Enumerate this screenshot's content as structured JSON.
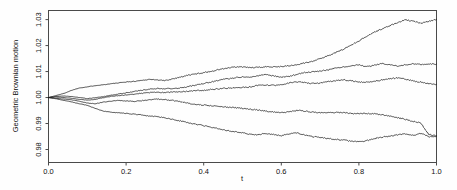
{
  "chart_data": {
    "type": "line",
    "title": "",
    "subtitle": "",
    "xlabel": "t",
    "ylabel": "Geometric Brownian motion",
    "xlim": [
      0.0,
      1.0
    ],
    "ylim": [
      0.975,
      1.0335
    ],
    "grid": false,
    "legend": null,
    "legend_position": "none",
    "x_ticks": [
      "0.0",
      "0.2",
      "0.4",
      "0.6",
      "0.8",
      "1.0"
    ],
    "x_tick_values": [
      0.0,
      0.2,
      0.4,
      0.6,
      0.8,
      1.0
    ],
    "y_ticks": [
      "0.98",
      "0.99",
      "1.00",
      "1.01",
      "1.02",
      "1.03"
    ],
    "y_tick_values": [
      0.98,
      0.99,
      1.0,
      1.01,
      1.02,
      1.03
    ],
    "x": [
      0.0,
      0.02,
      0.04,
      0.06,
      0.08,
      0.1,
      0.12,
      0.14,
      0.16,
      0.18,
      0.2,
      0.22,
      0.24,
      0.26,
      0.28,
      0.3,
      0.32,
      0.34,
      0.36,
      0.38,
      0.4,
      0.42,
      0.44,
      0.46,
      0.48,
      0.5,
      0.52,
      0.54,
      0.56,
      0.58,
      0.6,
      0.62,
      0.64,
      0.66,
      0.68,
      0.7,
      0.72,
      0.74,
      0.76,
      0.78,
      0.8,
      0.82,
      0.84,
      0.86,
      0.88,
      0.9,
      0.92,
      0.94,
      0.96,
      0.98,
      1.0
    ],
    "series": [
      {
        "name": "path-1",
        "values": [
          1.0,
          1.0008,
          1.0016,
          1.0028,
          1.0037,
          1.0041,
          1.0046,
          1.0049,
          1.0053,
          1.0056,
          1.006,
          1.0062,
          1.0066,
          1.007,
          1.0068,
          1.0065,
          1.0072,
          1.0079,
          1.0086,
          1.0091,
          1.0096,
          1.0101,
          1.0108,
          1.0113,
          1.0117,
          1.0118,
          1.0115,
          1.0116,
          1.0118,
          1.0119,
          1.0119,
          1.0122,
          1.0126,
          1.0133,
          1.014,
          1.0149,
          1.0161,
          1.0173,
          1.0186,
          1.0202,
          1.0218,
          1.0236,
          1.0252,
          1.0264,
          1.0277,
          1.0288,
          1.0299,
          1.0293,
          1.0287,
          1.0294,
          1.0301
        ]
      },
      {
        "name": "path-2",
        "values": [
          1.0,
          1.0004,
          1.0006,
          1.0004,
          1.0,
          0.9996,
          0.9999,
          1.0003,
          1.0008,
          1.0014,
          1.0018,
          1.0023,
          1.0028,
          1.0032,
          1.0035,
          1.0034,
          1.0035,
          1.0037,
          1.0042,
          1.0048,
          1.0054,
          1.006,
          1.0067,
          1.0072,
          1.0076,
          1.0079,
          1.0078,
          1.0083,
          1.0089,
          1.0083,
          1.0079,
          1.0082,
          1.0089,
          1.0096,
          1.0099,
          1.0102,
          1.0106,
          1.0114,
          1.0118,
          1.0122,
          1.0126,
          1.0119,
          1.0124,
          1.0131,
          1.0126,
          1.0121,
          1.0126,
          1.013,
          1.0128,
          1.0128,
          1.0129
        ]
      },
      {
        "name": "path-3",
        "values": [
          1.0,
          1.0002,
          1.0,
          0.9997,
          0.9993,
          0.999,
          0.9993,
          0.9999,
          1.0004,
          1.0007,
          1.001,
          1.0013,
          1.0016,
          1.0019,
          1.002,
          1.0019,
          1.0021,
          1.0023,
          1.0024,
          1.0026,
          1.0028,
          1.0031,
          1.0034,
          1.0036,
          1.0038,
          1.0039,
          1.0041,
          1.0047,
          1.0048,
          1.0047,
          1.0049,
          1.0056,
          1.0061,
          1.0058,
          1.0054,
          1.0056,
          1.0061,
          1.0065,
          1.0068,
          1.0064,
          1.006,
          1.0059,
          1.0062,
          1.0068,
          1.0072,
          1.0076,
          1.0071,
          1.0064,
          1.0059,
          1.0054,
          1.0051
        ]
      },
      {
        "name": "path-4",
        "values": [
          1.0,
          0.9997,
          0.9994,
          0.9991,
          0.9986,
          0.9979,
          0.9976,
          0.9982,
          0.9986,
          0.9989,
          0.9987,
          0.9985,
          0.9988,
          0.9991,
          0.9994,
          0.9992,
          0.9989,
          0.9984,
          0.9978,
          0.9973,
          0.9971,
          0.9969,
          0.9966,
          0.9963,
          0.9961,
          0.9958,
          0.9955,
          0.9952,
          0.9948,
          0.9944,
          0.9942,
          0.9945,
          0.9951,
          0.9948,
          0.9944,
          0.9942,
          0.9941,
          0.9943,
          0.9942,
          0.9939,
          0.9938,
          0.9939,
          0.9937,
          0.9934,
          0.9929,
          0.9922,
          0.9916,
          0.9908,
          0.9901,
          0.9858,
          0.9853
        ]
      },
      {
        "name": "path-5",
        "values": [
          1.0,
          0.9995,
          0.9989,
          0.9983,
          0.9976,
          0.997,
          0.9958,
          0.9948,
          0.9944,
          0.9941,
          0.9939,
          0.9936,
          0.9933,
          0.9929,
          0.9926,
          0.9922,
          0.9916,
          0.991,
          0.9903,
          0.9898,
          0.9892,
          0.9886,
          0.9879,
          0.9873,
          0.9869,
          0.9864,
          0.9859,
          0.9857,
          0.9862,
          0.9858,
          0.9853,
          0.986,
          0.9864,
          0.9856,
          0.985,
          0.9846,
          0.9842,
          0.9839,
          0.9836,
          0.9832,
          0.9829,
          0.9834,
          0.9842,
          0.9848,
          0.9851,
          0.9856,
          0.986,
          0.9855,
          0.9863,
          0.9849,
          0.9851
        ]
      }
    ]
  }
}
